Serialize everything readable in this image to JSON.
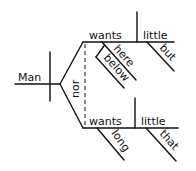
{
  "diagram": {
    "type": "sentence-diagram",
    "subject": "Man",
    "conjunction": "nor",
    "upper_clause": {
      "verb": "wants",
      "object": "little",
      "verb_modifiers": [
        "here",
        "below"
      ],
      "object_modifier": "but"
    },
    "lower_clause": {
      "verb": "wants",
      "verb_modifier": "long",
      "object": "little",
      "object_modifier": "that"
    }
  }
}
